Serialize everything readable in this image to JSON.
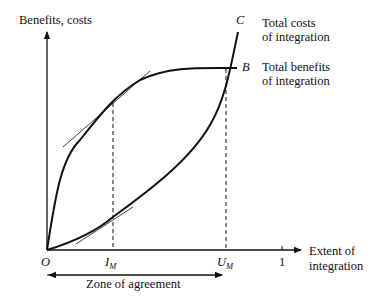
{
  "diagram": {
    "y_axis_label": "Benefits, costs",
    "x_axis_label_line1": "Extent of",
    "x_axis_label_line2": "integration",
    "origin_label": "O",
    "im_label": "I",
    "im_sub": "M",
    "um_label": "U",
    "um_sub": "M",
    "tick_one_label": "1",
    "curve_c_letter": "C",
    "curve_c_line1": "Total costs",
    "curve_c_line2": "of integration",
    "curve_b_letter": "B",
    "curve_b_line1": "Total benefits",
    "curve_b_line2": "of integration",
    "zone_label": "Zone of agreement"
  },
  "colors": {
    "ink": "#111111",
    "background": "#ffffff"
  }
}
